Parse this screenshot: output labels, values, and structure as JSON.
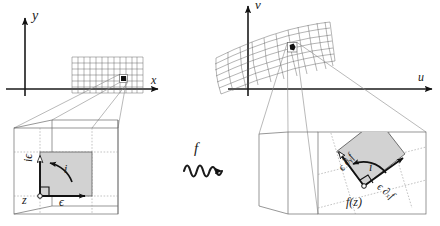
{
  "figure": {
    "type": "math-diagram"
  },
  "domain_plane": {
    "name": "source-plane",
    "axis_x_label": "x",
    "axis_y_label": "y",
    "grid": {
      "name": "rectangular-grid",
      "cols": 12,
      "rows": 6,
      "style": "regular"
    },
    "marker_label": "highlighted-cell"
  },
  "codomain_plane": {
    "name": "target-plane",
    "axis_x_label": "u",
    "axis_y_label": "v",
    "grid": {
      "name": "curvilinear-grid",
      "cols": 12,
      "rows": 6,
      "style": "warped"
    },
    "marker_label": "highlighted-cell"
  },
  "map": {
    "function_label": "f",
    "arrow": "squiggly-arrow"
  },
  "zoom_left": {
    "name": "magnified-source-cell",
    "origin_label": "z",
    "vector_real_label": "ϵ",
    "vector_imag_label": "iϵ",
    "rotation_label": "i",
    "right_angle": true
  },
  "zoom_right": {
    "name": "magnified-target-cell",
    "origin_label": "f(z)",
    "vector_real_label": "ϵ ∂ₓf",
    "vector_imag_label": "ϵ ∂ᵧf",
    "rotation_label": "i",
    "right_angle": true,
    "rotation_deg": -38
  },
  "colors": {
    "ink": "#1a1a1a",
    "square_fill": "#d2d2d2",
    "grid": "#5a5a5a",
    "guide": "#9a9a9a"
  }
}
